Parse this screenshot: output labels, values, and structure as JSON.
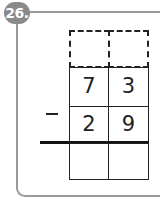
{
  "problem": {
    "number": "26.",
    "operator": "−",
    "rows": {
      "carry": [
        "",
        ""
      ],
      "minuend": [
        "7",
        "3"
      ],
      "subtrahend": [
        "2",
        "9"
      ],
      "answer": [
        "",
        ""
      ]
    }
  }
}
